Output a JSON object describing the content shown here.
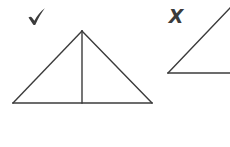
{
  "canvas": {
    "width": 230,
    "height": 147,
    "background_color": "#ffffff",
    "stroke_color": "#3b3b3b",
    "stroke_width": 1.4
  },
  "figures": [
    {
      "id": "correct-triangle",
      "name": "triangle-with-altitude",
      "label": "correct",
      "mark": "check",
      "mark_glyph": "✔",
      "mark_color": "#3b3b3b",
      "mark_position": {
        "x": 28,
        "y": 10
      },
      "vertices": {
        "apex": {
          "x": 82,
          "y": 31
        },
        "bottom_left": {
          "x": 13,
          "y": 103
        },
        "bottom_right": {
          "x": 152,
          "y": 103
        }
      },
      "altitude": {
        "from": {
          "x": 82,
          "y": 31
        },
        "to": {
          "x": 82,
          "y": 103
        }
      },
      "segments": [
        {
          "name": "left-side",
          "x1": 13,
          "y1": 103,
          "x2": 82,
          "y2": 31
        },
        {
          "name": "right-side",
          "x1": 82,
          "y1": 31,
          "x2": 152,
          "y2": 103
        },
        {
          "name": "base",
          "x1": 13,
          "y1": 103,
          "x2": 152,
          "y2": 103
        },
        {
          "name": "altitude",
          "x1": 82,
          "y1": 31,
          "x2": 82,
          "y2": 103
        }
      ]
    },
    {
      "id": "incorrect-angle",
      "name": "open-angle-figure",
      "label": "incorrect",
      "mark": "cross",
      "mark_glyph": "✗",
      "mark_text": "X",
      "mark_color": "#3b3b3b",
      "mark_position": {
        "x": 168,
        "y": 11
      },
      "vertex": {
        "x": 168,
        "y": 73
      },
      "segments": [
        {
          "name": "diagonal-ray",
          "x1": 168,
          "y1": 73,
          "x2": 230,
          "y2": 8
        },
        {
          "name": "horizontal-ray",
          "x1": 168,
          "y1": 73,
          "x2": 230,
          "y2": 73
        }
      ]
    }
  ]
}
